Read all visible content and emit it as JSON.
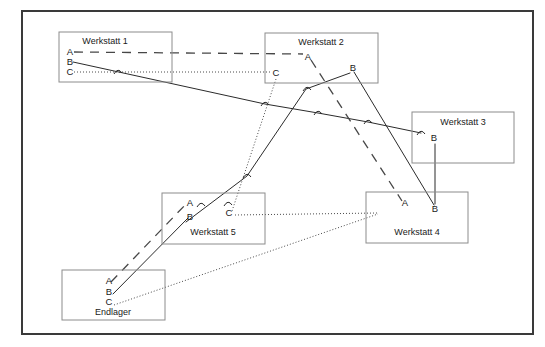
{
  "diagram": {
    "frame": {
      "x": 22,
      "y": 11,
      "width": 511,
      "height": 323
    },
    "colors": {
      "frame_stroke": "#3a3a3a",
      "node_stroke": "#8c8c8c",
      "line_solid": "#2b2b2b",
      "line_dashed": "#474747",
      "line_dotted": "#4a4a4a",
      "text": "#1a1a1a",
      "background": "#ffffff"
    },
    "nodes": [
      {
        "id": "werkstatt-1",
        "label": "Werkstatt 1",
        "x": 59,
        "y": 32,
        "width": 113,
        "height": 50,
        "title_x": 105,
        "title_y": 44,
        "ports": [
          {
            "name": "A",
            "x": 70,
            "y": 55
          },
          {
            "name": "B",
            "x": 70,
            "y": 65
          },
          {
            "name": "C",
            "x": 70,
            "y": 75
          }
        ]
      },
      {
        "id": "werkstatt-2",
        "label": "Werkstatt 2",
        "x": 265,
        "y": 33,
        "width": 113,
        "height": 50,
        "title_x": 321,
        "title_y": 45,
        "ports": [
          {
            "name": "A",
            "x": 308,
            "y": 60
          },
          {
            "name": "B",
            "x": 353,
            "y": 71
          },
          {
            "name": "C",
            "x": 276,
            "y": 76
          }
        ]
      },
      {
        "id": "werkstatt-3",
        "label": "Werkstatt 3",
        "x": 412,
        "y": 112,
        "width": 102,
        "height": 51,
        "title_x": 463,
        "title_y": 125,
        "ports": [
          {
            "name": "B",
            "x": 434,
            "y": 141
          }
        ]
      },
      {
        "id": "werkstatt-5",
        "label": "Werkstatt 5",
        "x": 162,
        "y": 193,
        "width": 103,
        "height": 51,
        "title_x": 213,
        "title_y": 235,
        "ports": [
          {
            "name": "A",
            "x": 190,
            "y": 206
          },
          {
            "name": "B",
            "x": 190,
            "y": 220
          },
          {
            "name": "C",
            "x": 229,
            "y": 216
          }
        ]
      },
      {
        "id": "werkstatt-4",
        "label": "Werkstatt 4",
        "x": 366,
        "y": 192,
        "width": 102,
        "height": 51,
        "title_x": 417,
        "title_y": 235,
        "ports": [
          {
            "name": "A",
            "x": 405,
            "y": 206
          },
          {
            "name": "B",
            "x": 435,
            "y": 212
          }
        ]
      },
      {
        "id": "endlager",
        "label": "Endlager",
        "x": 62,
        "y": 270,
        "width": 103,
        "height": 50,
        "title_x": 113,
        "title_y": 315,
        "ports": [
          {
            "name": "A",
            "x": 109,
            "y": 284
          },
          {
            "name": "B",
            "x": 109,
            "y": 295
          },
          {
            "name": "C",
            "x": 109,
            "y": 305
          }
        ]
      }
    ],
    "routes": [
      {
        "id": "route-a-w1-w2",
        "style": "dashed",
        "from": "werkstatt-1.A",
        "to": "werkstatt-2.A",
        "points": "74,52 303,54"
      },
      {
        "id": "route-c-w1-w2",
        "style": "dotted",
        "from": "werkstatt-1.C",
        "to": "werkstatt-2.C",
        "points": "74,72 271,72"
      },
      {
        "id": "route-b-w1-w3",
        "style": "solid",
        "from": "werkstatt-1.B",
        "to": "werkstatt-3.B",
        "points": "73,62 265,104 318,113 368,122 421,133"
      },
      {
        "id": "route-a-w2-w4",
        "style": "dashed",
        "from": "werkstatt-2.A",
        "to": "werkstatt-4.A",
        "points": "311,60 402,201"
      },
      {
        "id": "route-b-w2-w4",
        "style": "solid",
        "from": "werkstatt-2.B",
        "to": "werkstatt-4.B",
        "points": "354,72 434,205"
      },
      {
        "id": "route-b-w3-w4",
        "style": "solid",
        "from": "werkstatt-3.B",
        "to": "werkstatt-4.B",
        "points": "435,144 435,204"
      },
      {
        "id": "route-c-w2-w5",
        "style": "dotted",
        "from": "werkstatt-2.C",
        "to": "werkstatt-5.C",
        "points": "276,79 232,211"
      },
      {
        "id": "route-c-w5-w4",
        "style": "dotted",
        "from": "werkstatt-5.C",
        "to": "werkstatt-4",
        "points": "235,215 378,213"
      },
      {
        "id": "route-c-endlager-w4",
        "style": "dotted",
        "from": "endlager.C",
        "to": "werkstatt-4",
        "points": "114,305 378,214"
      },
      {
        "id": "route-b-w5-w2",
        "style": "solid",
        "from": "werkstatt-5.B",
        "to": "werkstatt-2.B",
        "points": "186,222 247,176 306,89 350,73"
      },
      {
        "id": "route-a-endlager-w5",
        "style": "dashed",
        "from": "endlager.A",
        "to": "werkstatt-5.A",
        "points": "111,282 187,203"
      },
      {
        "id": "route-b-endlager-w5",
        "style": "solid",
        "from": "endlager.B",
        "to": "werkstatt-5.B",
        "points": "113,294 188,218"
      }
    ],
    "hops": [
      {
        "id": "hop-1",
        "x": 118,
        "y": 72
      },
      {
        "id": "hop-2",
        "x": 265,
        "y": 104
      },
      {
        "id": "hop-3",
        "x": 318,
        "y": 113
      },
      {
        "id": "hop-4",
        "x": 368,
        "y": 122
      },
      {
        "id": "hop-5",
        "x": 421,
        "y": 133
      },
      {
        "id": "hop-6",
        "x": 307,
        "y": 89
      },
      {
        "id": "hop-7",
        "x": 201,
        "y": 205
      },
      {
        "id": "hop-8",
        "x": 228,
        "y": 204
      },
      {
        "id": "hop-9",
        "x": 247,
        "y": 176
      }
    ]
  }
}
